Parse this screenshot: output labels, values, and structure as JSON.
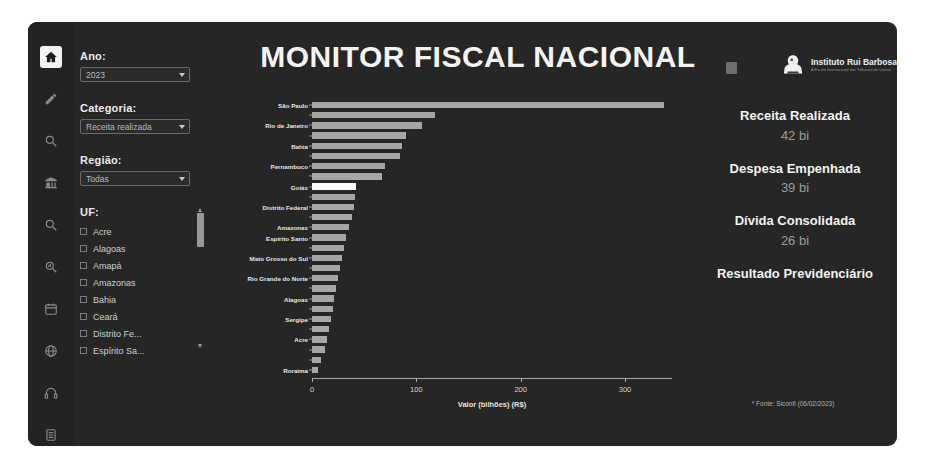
{
  "app": {
    "title": "MONITOR FISCAL NACIONAL",
    "source_note": "* Fonte: Siconfi (06/02/2023)"
  },
  "logo": {
    "name": "Instituto Rui Barbosa",
    "subtitle": "A Escola Internacional dos Tribunais de Contas"
  },
  "rail": {
    "items": [
      {
        "icon": "home-icon",
        "active": true
      },
      {
        "icon": "pencil-icon",
        "active": false
      },
      {
        "icon": "search-icon",
        "active": false
      },
      {
        "icon": "bank-icon",
        "active": false
      },
      {
        "icon": "magnifier-icon",
        "active": false
      },
      {
        "icon": "magnifier-chart-icon",
        "active": false
      },
      {
        "icon": "calendar-icon",
        "active": false
      },
      {
        "icon": "globe-icon",
        "active": false
      },
      {
        "icon": "headphones-icon",
        "active": false
      },
      {
        "icon": "document-icon",
        "active": false
      }
    ]
  },
  "filters": {
    "ano": {
      "label": "Ano:",
      "value": "2023"
    },
    "categoria": {
      "label": "Categoria:",
      "value": "Receita realizada"
    },
    "regiao": {
      "label": "Região:",
      "value": "Todas"
    },
    "uf": {
      "label": "UF:",
      "items": [
        {
          "label": "Acre",
          "checked": false
        },
        {
          "label": "Alagoas",
          "checked": false
        },
        {
          "label": "Amapá",
          "checked": false
        },
        {
          "label": "Amazonas",
          "checked": false
        },
        {
          "label": "Bahia",
          "checked": false
        },
        {
          "label": "Ceará",
          "checked": false
        },
        {
          "label": "Distrito Fe...",
          "checked": false
        },
        {
          "label": "Espírito Sa...",
          "checked": false
        }
      ]
    }
  },
  "kpis": [
    {
      "title": "Receita Realizada",
      "value": "42 bi"
    },
    {
      "title": "Despesa Empenhada",
      "value": "39 bi"
    },
    {
      "title": "Dívida Consolidada",
      "value": "26 bi"
    },
    {
      "title": "Resultado Previdenciário",
      "value": ""
    }
  ],
  "colors": {
    "panel_bg": "#262626",
    "rail_bg": "#232323",
    "bar": "#a6a6a6",
    "bar_highlight": "#fafafa",
    "text": "#f2f2f2",
    "muted": "#9e9e9e"
  },
  "chart_data": {
    "type": "bar",
    "orientation": "horizontal",
    "title": "",
    "xlabel": "Valor (bilhões) (R$)",
    "ylabel": "",
    "xlim": [
      0,
      345
    ],
    "xticks": [
      0,
      100,
      200,
      300
    ],
    "grid": false,
    "highlight_category": "Goiás",
    "categories": [
      "São Paulo",
      "Minas Gerais",
      "Rio de Janeiro",
      "Paraná",
      "Bahia",
      "Rio Grande do Sul",
      "Pernambuco",
      "Santa Catarina",
      "Goiás",
      "Ceará",
      "Distrito Federal",
      "Pará",
      "Amazonas",
      "Espírito Santo",
      "Mato Grosso",
      "Mato Grosso do Sul",
      "Maranhão",
      "Rio Grande do Norte",
      "Paraíba",
      "Alagoas",
      "Piauí",
      "Sergipe",
      "Rondônia",
      "Acre",
      "Tocantins",
      "Amapá",
      "Roraima"
    ],
    "labeled_categories": [
      "São Paulo",
      "Rio de Janeiro",
      "Bahia",
      "Pernambuco",
      "Goiás",
      "Distrito Federal",
      "Amazonas",
      "Espírito Santo",
      "Mato Grosso do Sul",
      "Rio Grande do Norte",
      "Alagoas",
      "Sergipe",
      "Acre",
      "Roraima"
    ],
    "values": [
      337,
      118,
      105,
      90,
      86,
      84,
      70,
      67,
      42,
      41,
      40,
      38,
      35,
      33,
      31,
      29,
      27,
      25,
      23,
      21,
      20,
      18,
      16,
      14,
      12,
      9,
      6
    ],
    "units": "bilhões de R$"
  }
}
